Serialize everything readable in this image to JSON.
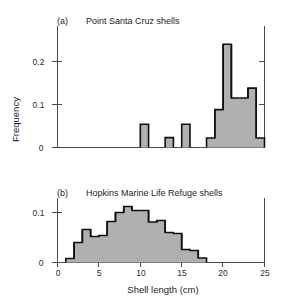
{
  "figure": {
    "xlabel": "Shell length (cm)",
    "ylabel": "Frequency",
    "bar_fill_color": "#b0b0b0",
    "bar_edge_color": "#101010",
    "axis_color": "#4a4a4a"
  },
  "panels": {
    "a": {
      "tag": "(a)",
      "title": "Point Santa Cruz shells",
      "y_ticks": [
        "0",
        "0.1",
        "0.2"
      ],
      "x_ticks": [
        "0",
        "5",
        "10",
        "15",
        "20",
        "25"
      ]
    },
    "b": {
      "tag": "(b)",
      "title": "Hopkins Marine Life Refuge shells",
      "y_ticks": [
        "0",
        "0.1"
      ],
      "x_ticks": [
        "0",
        "5",
        "10",
        "15",
        "20",
        "25"
      ]
    }
  },
  "chart_data": [
    {
      "type": "bar",
      "panel": "a",
      "title": "Point Santa Cruz shells",
      "subtitle": "(a)",
      "xlabel": "Shell length (cm)",
      "ylabel": "Frequency",
      "xlim": [
        0,
        25
      ],
      "ylim": [
        0,
        0.26
      ],
      "bin_width": 1,
      "grid": false,
      "legend": "none",
      "bin_starts": [
        0,
        1,
        2,
        3,
        4,
        5,
        6,
        7,
        8,
        9,
        10,
        11,
        12,
        13,
        14,
        15,
        16,
        17,
        18,
        19,
        20,
        21,
        22,
        23,
        24
      ],
      "values": [
        0,
        0,
        0,
        0,
        0,
        0,
        0,
        0,
        0,
        0,
        0.054,
        0,
        0,
        0.023,
        0,
        0.054,
        0,
        0,
        0.022,
        0.088,
        0.24,
        0.115,
        0.115,
        0.138,
        0.022
      ],
      "y_tick_values": [
        0,
        0.1,
        0.2
      ],
      "x_tick_values": [
        0,
        5,
        10,
        15,
        20,
        25
      ]
    },
    {
      "type": "bar",
      "panel": "b",
      "title": "Hopkins Marine Life Refuge shells",
      "subtitle": "(b)",
      "xlabel": "Shell length (cm)",
      "ylabel": "Frequency",
      "xlim": [
        0,
        25
      ],
      "ylim": [
        0,
        0.135
      ],
      "bin_width": 1,
      "grid": false,
      "legend": "none",
      "bin_starts": [
        0,
        1,
        2,
        3,
        4,
        5,
        6,
        7,
        8,
        9,
        10,
        11,
        12,
        13,
        14,
        15,
        16,
        17,
        18,
        19,
        20,
        21,
        22,
        23,
        24
      ],
      "values": [
        0,
        0.008,
        0.04,
        0.066,
        0.052,
        0.054,
        0.082,
        0.1,
        0.112,
        0.104,
        0.104,
        0.081,
        0.084,
        0.06,
        0.058,
        0.026,
        0.024,
        0.009,
        0,
        0,
        0,
        0,
        0,
        0,
        0
      ],
      "y_tick_values": [
        0,
        0.1
      ],
      "x_tick_values": [
        0,
        5,
        10,
        15,
        20,
        25
      ]
    }
  ]
}
